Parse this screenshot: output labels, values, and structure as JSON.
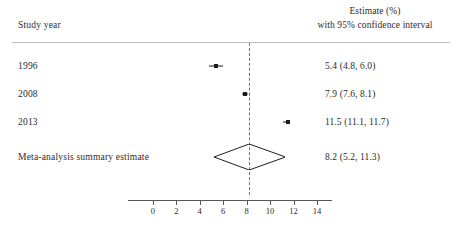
{
  "header": {
    "left_label": "Study year",
    "right_line1": "Estimate (%)",
    "right_line2": "with 95% confidence interval"
  },
  "chart_data": {
    "type": "forest",
    "title": "",
    "xlabel": "",
    "ylabel": "",
    "xlim": [
      -1,
      15
    ],
    "xticks": [
      0,
      2,
      4,
      6,
      8,
      10,
      12,
      14
    ],
    "xtick_labels": [
      "0",
      "2",
      "4",
      "6",
      "8",
      "10",
      "12",
      "14"
    ],
    "grid": false,
    "reference_line": 8.2,
    "columns": [
      "Study year",
      "Estimate (%) with 95% confidence interval"
    ],
    "rows": [
      {
        "label": "1996",
        "estimate": 5.4,
        "ci_low": 4.8,
        "ci_high": 6.0,
        "value_text": "5.4 (4.8, 6.0)",
        "marker": "square",
        "is_summary": false
      },
      {
        "label": "2008",
        "estimate": 7.9,
        "ci_low": 7.6,
        "ci_high": 8.1,
        "value_text": "7.9 (7.6, 8.1)",
        "marker": "square",
        "is_summary": false
      },
      {
        "label": "2013",
        "estimate": 11.5,
        "ci_low": 11.1,
        "ci_high": 11.7,
        "value_text": "11.5 (11.1, 11.7)",
        "marker": "square",
        "is_summary": false
      },
      {
        "label": "Meta-analysis summary estimate",
        "estimate": 8.2,
        "ci_low": 5.2,
        "ci_high": 11.3,
        "value_text": "8.2 (5.2, 11.3)",
        "marker": "diamond",
        "is_summary": true
      }
    ]
  },
  "colors": {
    "marker": "#1d1d1d",
    "reference_line": "#707070",
    "axis": "#575757",
    "rule": "#bdbdbd",
    "text": "#2b2b2b",
    "background": "#ffffff"
  }
}
